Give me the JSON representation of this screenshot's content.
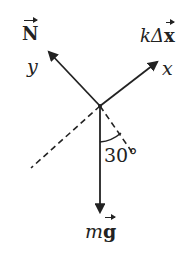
{
  "diagram": {
    "type": "free-body-diagram",
    "forces": [
      {
        "name": "normal",
        "symbol": "N",
        "direction": "up-left (along +y)"
      },
      {
        "name": "spring",
        "prefix": "kΔ",
        "symbol": "x",
        "direction": "up-right (along +x)"
      },
      {
        "name": "gravity",
        "prefix": "m",
        "symbol": "g",
        "direction": "down"
      }
    ],
    "axes": {
      "x_label": "x",
      "y_label": "y"
    },
    "angle_label": "30°",
    "colors": {
      "ink": "#222222",
      "background": "#ffffff"
    }
  }
}
